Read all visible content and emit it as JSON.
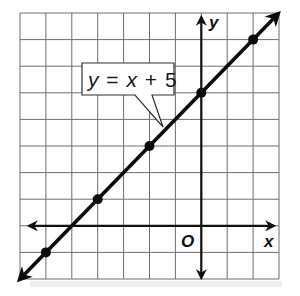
{
  "figure": {
    "type": "coordinate-graph",
    "equation_label": {
      "y": "y",
      "equals": "=",
      "x": "x",
      "plus": "+",
      "constant": "5",
      "full": "y = x + 5"
    },
    "axes": {
      "x_label": "x",
      "y_label": "y",
      "origin_label": "O"
    },
    "grid": {
      "x_min": -7,
      "x_max": 3,
      "y_min": -2,
      "y_max": 8,
      "step": 1
    },
    "line": {
      "slope": 1,
      "intercept": 5,
      "color": "#0a0a0a"
    },
    "points": [
      {
        "x": -6,
        "y": -1
      },
      {
        "x": -4,
        "y": 1
      },
      {
        "x": -2,
        "y": 3
      },
      {
        "x": 0,
        "y": 5
      },
      {
        "x": 2,
        "y": 7
      }
    ],
    "colors": {
      "grid": "#6e6e6e",
      "axes": "#111111",
      "background": "#ffffff"
    }
  }
}
